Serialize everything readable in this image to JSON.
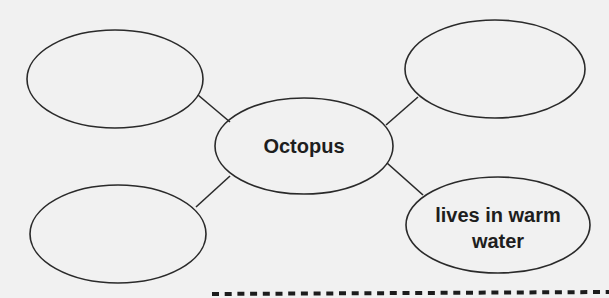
{
  "diagram": {
    "type": "concept web",
    "central_node": {
      "label": "Octopus"
    },
    "nodes": [
      {
        "position": "top-left",
        "lines": []
      },
      {
        "position": "top-right",
        "lines": []
      },
      {
        "position": "bottom-left",
        "lines": []
      },
      {
        "position": "bottom-right",
        "lines": [
          "lives in warm",
          "water"
        ]
      }
    ],
    "edges": [
      {
        "from": "Octopus",
        "to": "top-left"
      },
      {
        "from": "Octopus",
        "to": "top-right"
      },
      {
        "from": "Octopus",
        "to": "bottom-left"
      },
      {
        "from": "Octopus",
        "to": "bottom-right"
      }
    ],
    "cut_line": "dashed"
  }
}
